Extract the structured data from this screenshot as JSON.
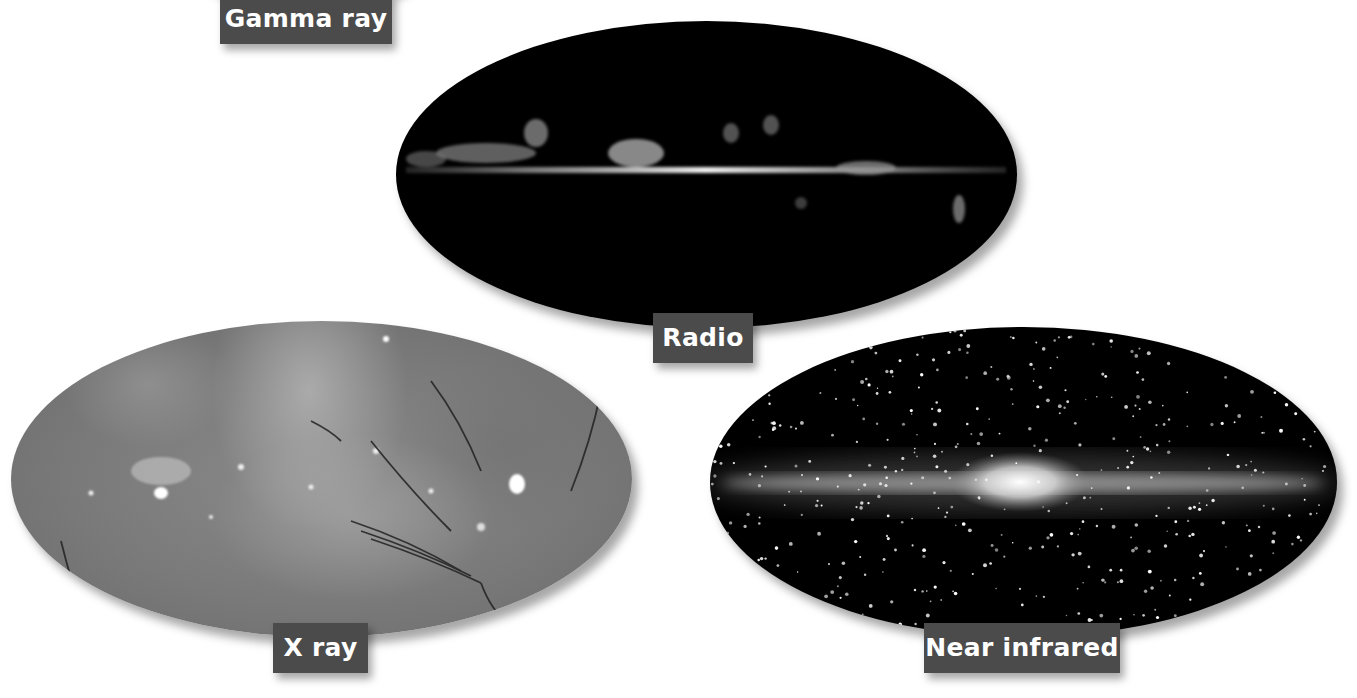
{
  "figure": {
    "panels": [
      {
        "id": "gamma",
        "label": "Gamma ray"
      },
      {
        "id": "radio",
        "label": "Radio"
      },
      {
        "id": "xray",
        "label": "X ray"
      },
      {
        "id": "nir",
        "label": "Near infrared"
      }
    ]
  },
  "colors": {
    "background": "#ffffff",
    "label_bg": "#4b4b4b",
    "label_text": "#ffffff",
    "sky_dark": "#000000",
    "xray_gray": "#7a7a7a"
  }
}
